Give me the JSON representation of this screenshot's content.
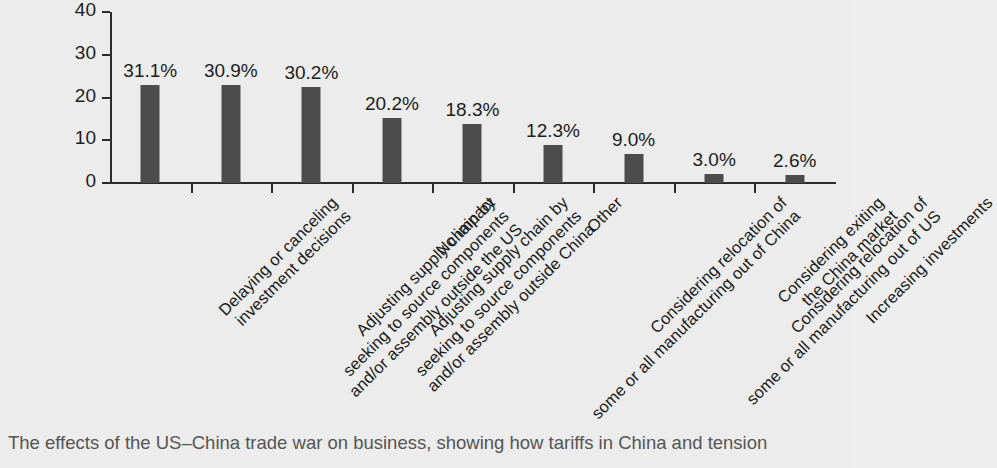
{
  "chart_data": {
    "type": "bar",
    "title": "",
    "xlabel": "",
    "ylabel": "",
    "ylim": [
      0,
      40
    ],
    "yticks": [
      0,
      10,
      20,
      30,
      40
    ],
    "grid": false,
    "legend": "none",
    "bar_color": "#4c4c4c",
    "background_color": "#ececec",
    "categories": [
      "Delaying or canceling\ninvestment decisions",
      "Adjusting supply chain by\nseeking to source components\nand/or assembly outside the US",
      "Adjusting supply chain by\nseeking to source components\nand/or assembly outside China",
      "No impact",
      "Considering relocation of\nsome or all manufacturing out of China",
      "Other",
      "Considering relocation of\nsome or all manufacturing out of US",
      "Considering exiting\nthe China market",
      "Increasing investments"
    ],
    "data_labels": [
      "31.1%",
      "30.9%",
      "30.2%",
      "20.2%",
      "18.3%",
      "12.3%",
      "9.0%",
      "3.0%",
      "2.6%"
    ],
    "percent_values": [
      31.1,
      30.9,
      30.2,
      20.2,
      18.3,
      12.3,
      9.0,
      3.0,
      2.6
    ],
    "plotted_values": [
      23.0,
      23.0,
      22.5,
      15.2,
      13.8,
      9.0,
      6.8,
      2.2,
      1.9
    ]
  },
  "caption": {
    "text": "The effects of the US–China trade war on business, showing how tariffs in China and tension"
  }
}
